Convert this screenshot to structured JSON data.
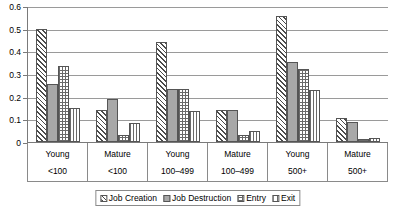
{
  "chart_data": {
    "type": "bar",
    "title": "",
    "subtitle": "",
    "xlabel": "",
    "ylabel": "",
    "ylim": [
      0,
      0.6
    ],
    "yticks": [
      "0",
      "0.1",
      "0.2",
      "0.3",
      "0.4",
      "0.5",
      "0.6"
    ],
    "ytick_values": [
      0,
      0.1,
      0.2,
      0.3,
      0.4,
      0.5,
      0.6
    ],
    "grid": true,
    "legend_position": "bottom",
    "categories": [
      {
        "age": "Young",
        "size": "<100"
      },
      {
        "age": "Mature",
        "size": "<100"
      },
      {
        "age": "Young",
        "size": "100–499"
      },
      {
        "age": "Mature",
        "size": "100–499"
      },
      {
        "age": "Young",
        "size": "500+"
      },
      {
        "age": "Mature",
        "size": "500+"
      }
    ],
    "series": [
      {
        "name": "Job Creation",
        "pattern": "diagonal-hatch",
        "values": [
          0.5,
          0.14,
          0.44,
          0.14,
          0.556,
          0.108
        ]
      },
      {
        "name": "Job Destruction",
        "pattern": "solid-gray",
        "values": [
          0.255,
          0.19,
          0.235,
          0.14,
          0.352,
          0.09
        ]
      },
      {
        "name": "Entry",
        "pattern": "crosshatch-grid",
        "values": [
          0.334,
          0.032,
          0.233,
          0.032,
          0.321,
          0.013
        ]
      },
      {
        "name": "Exit",
        "pattern": "vertical-lines",
        "values": [
          0.151,
          0.085,
          0.135,
          0.05,
          0.229,
          0.018
        ]
      }
    ]
  },
  "colors": {
    "axis": "#7a7a7a",
    "gridline": "#9a9a9a",
    "bar_outline": "#555555",
    "destruction_fill": "#a8a8a8",
    "background": "#ffffff"
  }
}
